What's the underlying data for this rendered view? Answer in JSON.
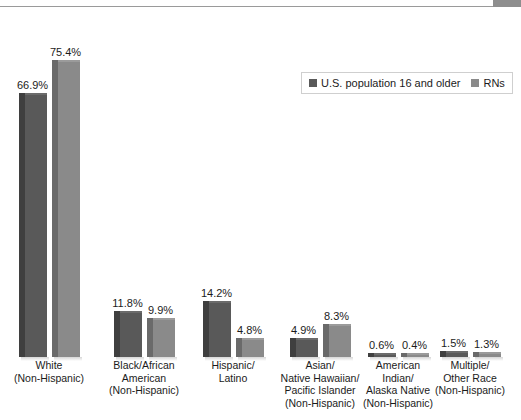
{
  "top_strip": {
    "ghost_text": ""
  },
  "legend": {
    "items": [
      {
        "label": "U.S. population 16 and older",
        "color": "#595959",
        "swatch_icon": "square-swatch-icon"
      },
      {
        "label": "RNs",
        "color": "#8a8a8a",
        "swatch_icon": "square-swatch-icon"
      }
    ]
  },
  "chart_data": {
    "type": "bar",
    "title": "",
    "subtitle": "",
    "xlabel": "",
    "ylabel": "",
    "ylim": [
      0,
      80
    ],
    "grid": false,
    "legend_position": "top-right",
    "value_suffix": "%",
    "categories": [
      "White\n(Non-Hispanic)",
      "Black/African\nAmerican\n(Non-Hispanic)",
      "Hispanic/\nLatino",
      "Asian/\nNative Hawaiian/\nPacific Islander\n(Non-Hispanic)",
      "American\nIndian/\nAlaska Native\n(Non-Hispanic)",
      "Multiple/\nOther Race\n(Non-Hispanic)"
    ],
    "category_lines": [
      [
        "White",
        "(Non-Hispanic)"
      ],
      [
        "Black/African",
        "American",
        "(Non-Hispanic)"
      ],
      [
        "Hispanic/",
        "Latino"
      ],
      [
        "Asian/",
        "Native Hawaiian/",
        "Pacific Islander",
        "(Non-Hispanic)"
      ],
      [
        "American",
        "Indian/",
        "Alaska Native",
        "(Non-Hispanic)"
      ],
      [
        "Multiple/",
        "Other Race",
        "(Non-Hispanic)"
      ]
    ],
    "series": [
      {
        "name": "U.S. population 16 and older",
        "color": "#595959",
        "values": [
          66.9,
          11.8,
          14.2,
          4.9,
          0.6,
          1.5
        ],
        "labels": [
          "66.9%",
          "11.8%",
          "14.2%",
          "4.9%",
          "0.6%",
          "1.5%"
        ]
      },
      {
        "name": "RNs",
        "color": "#8a8a8a",
        "values": [
          75.4,
          9.9,
          4.8,
          8.3,
          0.4,
          1.3
        ],
        "labels": [
          "75.4%",
          "9.9%",
          "4.8%",
          "8.3%",
          "0.4%",
          "1.3%"
        ]
      }
    ]
  }
}
